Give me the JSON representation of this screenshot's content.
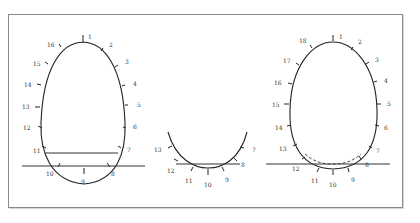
{
  "figures": [
    {
      "id": "left",
      "labels": [
        "1",
        "2",
        "3",
        "4",
        "5",
        "6",
        "7",
        "8",
        "9",
        "10",
        "11",
        "12",
        "13",
        "14",
        "15",
        "16"
      ],
      "description": "Full oval with 16 numbered tick marks, a ground line and a chord line near the base"
    },
    {
      "id": "middle",
      "labels": [
        "7",
        "8",
        "9",
        "10",
        "11",
        "12",
        "13"
      ],
      "description": "Lower arc segment with numbered ticks 7-13 and a chord line"
    },
    {
      "id": "right",
      "labels": [
        "1",
        "2",
        "3",
        "4",
        "5",
        "6",
        "7",
        "8",
        "9",
        "10",
        "11",
        "12",
        "13",
        "14",
        "15",
        "16",
        "17",
        "18"
      ],
      "description": "Full oval with 18 numbered tick marks, a ground line and a dashed inner arc near the base"
    }
  ],
  "colors": {
    "stroke": "#222222",
    "frame": "#8a8a8a",
    "background": "#ffffff"
  }
}
